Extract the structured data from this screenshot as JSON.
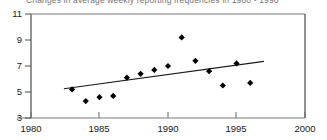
{
  "chart_data": {
    "type": "scatter",
    "title": "Changes in average weekly reporting frequencies in 1980 - 1996",
    "xlabel": "",
    "ylabel": "",
    "xlim": [
      1980,
      2000
    ],
    "ylim": [
      3,
      11
    ],
    "xticks": [
      1980,
      1985,
      1990,
      1995,
      2000
    ],
    "yticks": [
      3,
      5,
      7,
      9,
      11
    ],
    "xtick_labels": [
      "1980",
      "1985",
      "1990",
      "1995",
      "2000"
    ],
    "ytick_labels": [
      "3",
      "5",
      "7",
      "9",
      "11"
    ],
    "grid": false,
    "legend": "none",
    "marker": "diamond",
    "marker_color": "#000000",
    "x": [
      1983,
      1984,
      1985,
      1986,
      1987,
      1988,
      1989,
      1990,
      1991,
      1992,
      1993,
      1994,
      1995,
      1996
    ],
    "values": [
      5.2,
      4.3,
      4.6,
      4.7,
      6.1,
      6.4,
      6.7,
      7.0,
      9.2,
      7.4,
      6.6,
      5.5,
      7.2,
      5.7
    ],
    "series": [
      {
        "name": "Average weekly reporting frequency",
        "x": [
          1983,
          1984,
          1985,
          1986,
          1987,
          1988,
          1989,
          1990,
          1991,
          1992,
          1993,
          1994,
          1995,
          1996
        ],
        "values": [
          5.2,
          4.3,
          4.6,
          4.7,
          6.1,
          6.4,
          6.7,
          7.0,
          9.2,
          7.4,
          6.6,
          5.5,
          7.2,
          5.7
        ]
      }
    ],
    "trendline": {
      "name": "linear trend",
      "x": [
        1982.4,
        1997.0
      ],
      "values": [
        5.25,
        7.35
      ],
      "color": "#1a1a1a"
    }
  },
  "axes": {
    "y_labels": [
      "11",
      "9",
      "7",
      "5",
      "3"
    ],
    "x_labels": [
      "1980",
      "1985",
      "1990",
      "1995",
      "2000"
    ]
  }
}
